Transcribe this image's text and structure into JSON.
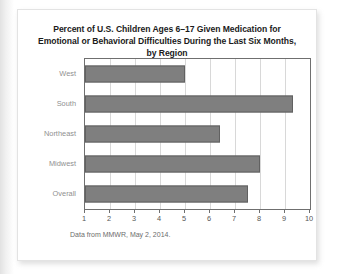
{
  "card": {
    "source_note": "Data from MMWR, May 2, 2014."
  },
  "chart_data": {
    "type": "bar",
    "orientation": "horizontal",
    "title": "Percent of U.S. Children Ages 6–17 Given Medication for Emotional or Behavioral Difficulties During the Last Six Months, by Region",
    "title_line1": "Percent of U.S. Children Ages 6–17 Given Medication for Emotional",
    "title_line2": "or Behavioral Difficulties During the Last Six Months, by Region",
    "categories": [
      "West",
      "South",
      "Northeast",
      "Midwest",
      "Overall"
    ],
    "values": [
      5.0,
      9.3,
      6.4,
      8.0,
      7.5
    ],
    "xlabel": "",
    "ylabel": "",
    "xlim": [
      1,
      10
    ],
    "xticks": [
      1,
      2,
      3,
      4,
      5,
      6,
      7,
      8,
      9,
      10
    ],
    "xtick_labels": [
      "1",
      "2",
      "3",
      "4",
      "5",
      "6",
      "7",
      "8",
      "9",
      "10"
    ],
    "grid": true,
    "grid_axis": "x",
    "legend": false,
    "bar_color": "#7f7f7f",
    "bar_edge_color": "#616161",
    "gridline_color": "#d8d8d8",
    "axis_color": "#6f6f6f",
    "label_color": "#8f8f8f",
    "background": "#ffffff"
  }
}
